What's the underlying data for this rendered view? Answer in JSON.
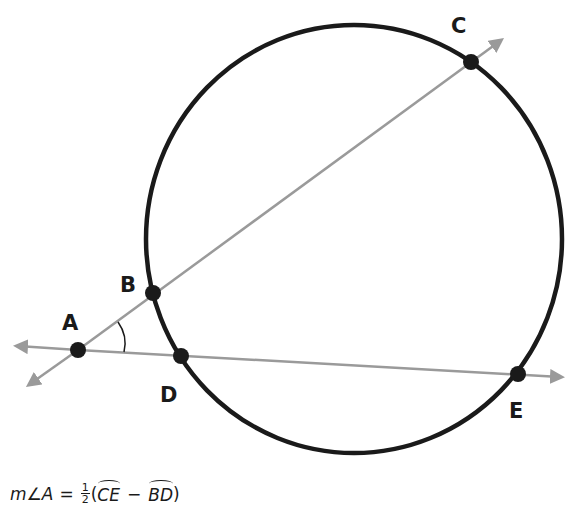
{
  "colors": {
    "background": "#ffffff",
    "circle": "#1a1a1a",
    "lines": "#9a9a9a",
    "points": "#1a1a1a"
  },
  "diagram": {
    "circle": {
      "cx": 354,
      "cy": 239,
      "rx": 208,
      "ry": 214
    },
    "points": [
      {
        "id": "A",
        "label": "A",
        "x": 78,
        "y": 350,
        "label_x": 62,
        "label_y": 330
      },
      {
        "id": "B",
        "label": "B",
        "x": 153,
        "y": 293,
        "label_x": 122,
        "label_y": 293
      },
      {
        "id": "C",
        "label": "C",
        "x": 471,
        "y": 62,
        "label_x": 452,
        "label_y": 32
      },
      {
        "id": "D",
        "label": "D",
        "x": 181,
        "y": 356,
        "label_x": 160,
        "label_y": 402
      },
      {
        "id": "E",
        "label": "E",
        "x": 518,
        "y": 374,
        "label_x": 509,
        "label_y": 417
      }
    ],
    "lines": [
      {
        "name": "secant-ABC",
        "through": [
          "A",
          "B",
          "C"
        ],
        "x1": 25,
        "y1": 388,
        "x2": 505,
        "y2": 38
      },
      {
        "name": "secant-ADE",
        "through": [
          "A",
          "D",
          "E"
        ],
        "x1": 12,
        "y1": 345,
        "x2": 566,
        "y2": 377
      }
    ],
    "angle_marked": "A"
  },
  "formula": {
    "lhs_m": "m",
    "lhs_angle": "∠",
    "lhs_vertex": "A",
    "equals": "=",
    "frac_num": "1",
    "frac_den": "2",
    "open_paren": "(",
    "arc1": "CE",
    "minus": "−",
    "arc2": "BD",
    "close_paren": ")"
  }
}
